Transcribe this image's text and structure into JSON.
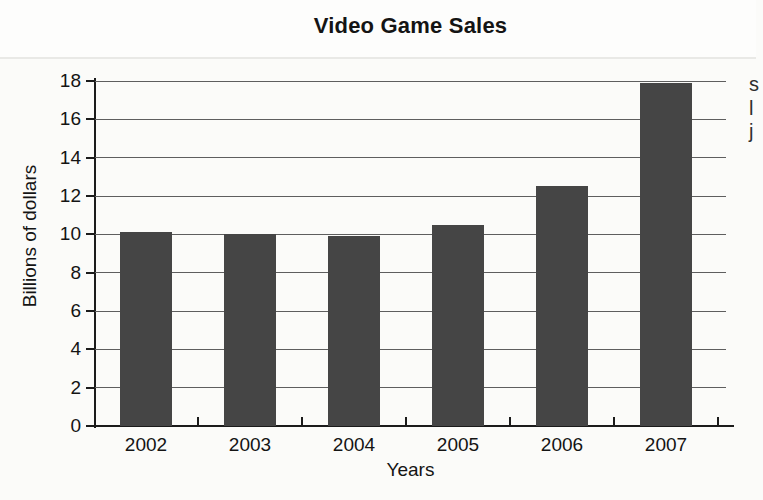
{
  "page": {
    "background": "#fbfbf9",
    "top_rule_color": "#e9e9e6",
    "edge_fragments": [
      {
        "char": "s"
      },
      {
        "char": "l"
      },
      {
        "char": "j"
      }
    ]
  },
  "chart_data": {
    "type": "bar",
    "title": "Video Game Sales",
    "xlabel": "Years",
    "ylabel": "Billions of dollars",
    "categories": [
      "2002",
      "2003",
      "2004",
      "2005",
      "2006",
      "2007"
    ],
    "values": [
      10.1,
      10,
      9.9,
      10.5,
      12.5,
      17.9
    ],
    "ylim": [
      0,
      18
    ],
    "yticks": [
      0,
      2,
      4,
      6,
      8,
      10,
      12,
      14,
      16,
      18
    ],
    "grid": "horizontal-behind-bars",
    "legend": "none",
    "bar_color": "#454545",
    "gridline_color": "#5e5e5e",
    "axis_color": "#1b1b1b",
    "text_color": "#141414"
  }
}
